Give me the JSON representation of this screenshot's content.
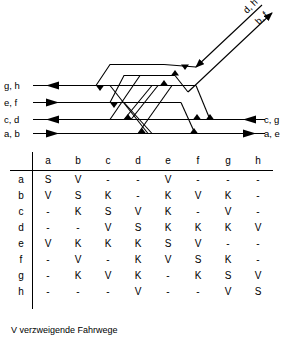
{
  "diagram": {
    "name": "track-topology-diagram",
    "left_labels": [
      "g, h",
      "e, f",
      "c, d",
      "a, b"
    ],
    "right_labels": [
      "c, g",
      "a, e"
    ],
    "diagonal_labels": [
      "d, h",
      "b, f"
    ],
    "line_color": "#000000"
  },
  "matrix": {
    "name": "route-conflict-matrix",
    "column_headers": [
      "a",
      "b",
      "c",
      "d",
      "e",
      "f",
      "g",
      "h"
    ],
    "row_headers": [
      "a",
      "b",
      "c",
      "d",
      "e",
      "f",
      "g",
      "h"
    ],
    "rows": [
      [
        "S",
        "V",
        "-",
        "-",
        "V",
        "-",
        "-",
        "-"
      ],
      [
        "V",
        "S",
        "K",
        "-",
        "K",
        "V",
        "K",
        "-"
      ],
      [
        "-",
        "K",
        "S",
        "V",
        "K",
        "-",
        "V",
        "-"
      ],
      [
        "-",
        "-",
        "V",
        "S",
        "K",
        "K",
        "K",
        "V"
      ],
      [
        "V",
        "K",
        "K",
        "K",
        "S",
        "V",
        "-",
        "-"
      ],
      [
        "-",
        "V",
        "-",
        "K",
        "V",
        "S",
        "K",
        "-"
      ],
      [
        "-",
        "K",
        "V",
        "K",
        "-",
        "K",
        "S",
        "V"
      ],
      [
        "-",
        "-",
        "-",
        "V",
        "-",
        "-",
        "V",
        "S"
      ]
    ]
  },
  "caption": {
    "text": "V verzweigende Fahrwege"
  }
}
